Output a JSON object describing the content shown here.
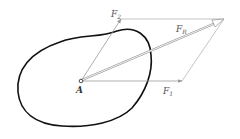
{
  "diagram": {
    "point": {
      "label": "A",
      "x": 81,
      "y": 81
    },
    "forces": [
      {
        "name": "F",
        "sub": "1",
        "from": [
          81,
          81
        ],
        "to": [
          182,
          81
        ]
      },
      {
        "name": "F",
        "sub": "2",
        "from": [
          81,
          81
        ],
        "to": [
          121,
          19
        ]
      },
      {
        "name": "F",
        "sub": "R",
        "from": [
          81,
          81
        ],
        "to": [
          224,
          19
        ]
      }
    ],
    "labels": {
      "f1_main": "F",
      "f1_sub": "1",
      "f2_main": "F",
      "f2_sub": "2",
      "fr_main": "F",
      "fr_sub": "R",
      "point_a": "A"
    },
    "colors": {
      "body_outline": "#111111",
      "force_lines": "#999999",
      "labels": "#555555"
    }
  }
}
